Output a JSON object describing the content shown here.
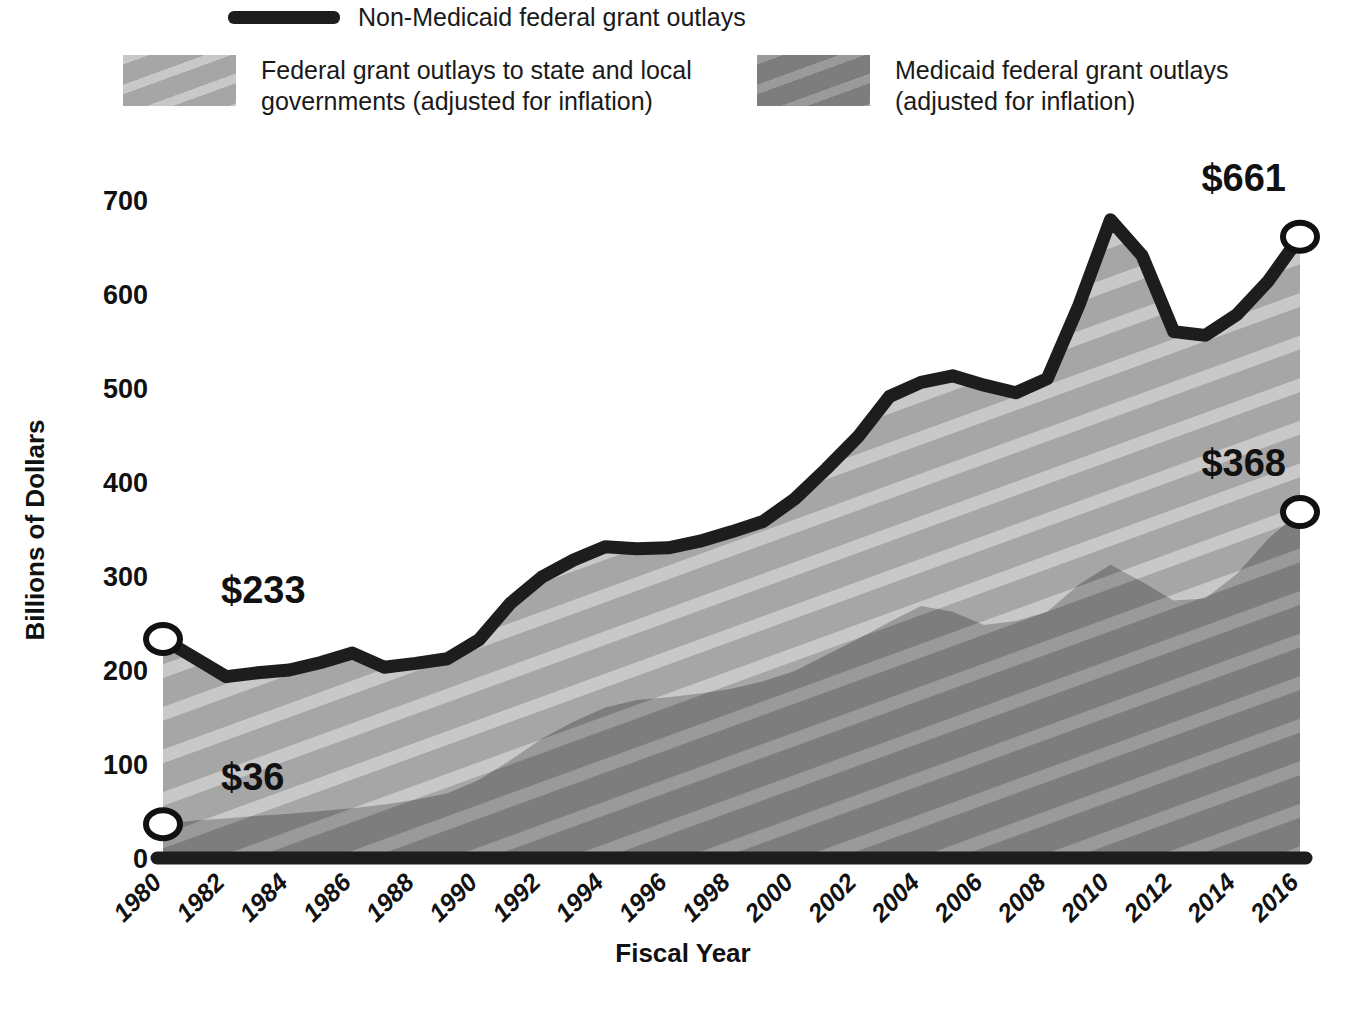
{
  "legend": {
    "line_entry": {
      "label": "Non-Medicaid federal grant outlays",
      "swatch": "thick-black-line"
    },
    "entries": [
      {
        "label": "Federal grant outlays to state and local\ngovernments (adjusted for inflation)",
        "swatch": "light-gray-diagonal-hatch",
        "color": "#a6a6a6"
      },
      {
        "label": "Medicaid federal grant outlays\n(adjusted for inflation)",
        "swatch": "dark-gray-diagonal-hatch",
        "color": "#7d7d7d"
      }
    ]
  },
  "chart_data": {
    "type": "area",
    "title": "",
    "xlabel": "Fiscal Year",
    "ylabel": "Billions of Dollars",
    "xlim": [
      1980,
      2016
    ],
    "ylim": [
      0,
      700
    ],
    "yticks": [
      0,
      100,
      200,
      300,
      400,
      500,
      600,
      700
    ],
    "ytick_labels": [
      "0",
      "100",
      "200",
      "300",
      "400",
      "500",
      "600",
      "700"
    ],
    "xticks": [
      1980,
      1982,
      1984,
      1986,
      1988,
      1990,
      1992,
      1994,
      1996,
      1998,
      2000,
      2002,
      2004,
      2006,
      2008,
      2010,
      2012,
      2014,
      2016
    ],
    "xtick_labels": [
      "1980",
      "1982",
      "1984",
      "1986",
      "1988",
      "1990",
      "1992",
      "1994",
      "1996",
      "1998",
      "2000",
      "2002",
      "2004",
      "2006",
      "2008",
      "2010",
      "2012",
      "2014",
      "2016"
    ],
    "grid": false,
    "legend_position": "above-plot",
    "x": [
      1980,
      1981,
      1982,
      1983,
      1984,
      1985,
      1986,
      1987,
      1988,
      1989,
      1990,
      1991,
      1992,
      1993,
      1994,
      1995,
      1996,
      1997,
      1998,
      1999,
      2000,
      2001,
      2002,
      2003,
      2004,
      2005,
      2006,
      2007,
      2008,
      2009,
      2010,
      2011,
      2012,
      2013,
      2014,
      2015,
      2016
    ],
    "series": [
      {
        "name": "Federal grant outlays to state and local governments (adjusted for inflation)",
        "color": "#a6a6a6",
        "values": [
          233,
          213,
          193,
          197,
          200,
          208,
          218,
          203,
          207,
          212,
          232,
          271,
          299,
          317,
          331,
          329,
          330,
          337,
          347,
          358,
          382,
          414,
          448,
          491,
          506,
          513,
          503,
          495,
          510,
          588,
          679,
          641,
          560,
          556,
          578,
          614,
          661
        ]
      },
      {
        "name": "Medicaid federal grant outlays (adjusted for inflation)",
        "color": "#7d7d7d",
        "values": [
          36,
          40,
          42,
          45,
          47,
          50,
          53,
          57,
          62,
          69,
          83,
          104,
          127,
          145,
          160,
          168,
          171,
          175,
          180,
          188,
          199,
          216,
          233,
          251,
          268,
          262,
          248,
          252,
          262,
          291,
          312,
          294,
          274,
          276,
          302,
          340,
          368
        ]
      }
    ],
    "annotations": [
      {
        "label": "$233",
        "x": 1980,
        "y": 233,
        "series": "total"
      },
      {
        "label": "$36",
        "x": 1980,
        "y": 36,
        "series": "medicaid"
      },
      {
        "label": "$661",
        "x": 2016,
        "y": 661,
        "series": "total"
      },
      {
        "label": "$368",
        "x": 2016,
        "y": 368,
        "series": "medicaid"
      }
    ],
    "markers": [
      {
        "x": 1980,
        "y": 233
      },
      {
        "x": 1980,
        "y": 36
      },
      {
        "x": 2016,
        "y": 661
      },
      {
        "x": 2016,
        "y": 368
      }
    ]
  }
}
